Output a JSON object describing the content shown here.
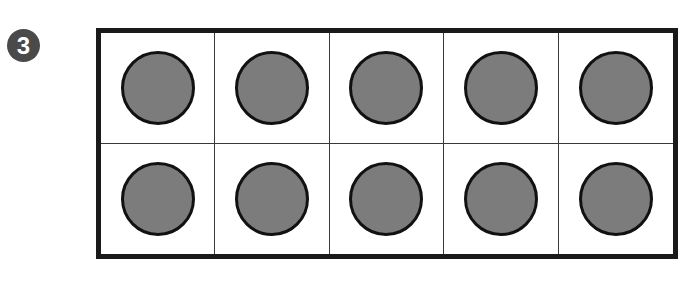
{
  "problem": {
    "number": "3"
  },
  "ten_frame": {
    "rows": 2,
    "columns": 5,
    "filled_count": 10,
    "cells": [
      {
        "row": 1,
        "col": 1,
        "filled": true
      },
      {
        "row": 1,
        "col": 2,
        "filled": true
      },
      {
        "row": 1,
        "col": 3,
        "filled": true
      },
      {
        "row": 1,
        "col": 4,
        "filled": true
      },
      {
        "row": 1,
        "col": 5,
        "filled": true
      },
      {
        "row": 2,
        "col": 1,
        "filled": true
      },
      {
        "row": 2,
        "col": 2,
        "filled": true
      },
      {
        "row": 2,
        "col": 3,
        "filled": true
      },
      {
        "row": 2,
        "col": 4,
        "filled": true
      },
      {
        "row": 2,
        "col": 5,
        "filled": true
      }
    ],
    "colors": {
      "counter_fill": "#7c7c7c",
      "counter_stroke": "#111111",
      "frame_border": "#1a1a1a",
      "badge_bg": "#4a4a4a"
    }
  }
}
